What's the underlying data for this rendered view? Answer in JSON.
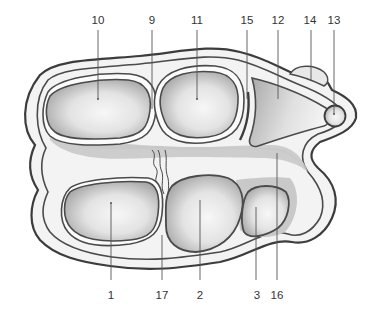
{
  "diagram": {
    "type": "anatomical cross-section",
    "colors": {
      "outline": "#4a4a4a",
      "skin_fill": "#f2f2f2",
      "tissue_fill": "#c8c8c8",
      "bone_dark": "#9e9e9e",
      "bone_light": "#f4f4f4",
      "label_text": "#333333"
    },
    "labels": [
      {
        "id": "1",
        "text": "1",
        "x": 111,
        "y": 296,
        "target": [
          111,
          203
        ],
        "position": "bottom"
      },
      {
        "id": "2",
        "text": "2",
        "x": 200,
        "y": 296,
        "target": [
          200,
          200
        ],
        "position": "bottom"
      },
      {
        "id": "3",
        "text": "3",
        "x": 257,
        "y": 296,
        "target": [
          256,
          207
        ],
        "position": "bottom"
      },
      {
        "id": "16",
        "text": "16",
        "x": 277,
        "y": 296,
        "target": [
          277,
          153
        ],
        "position": "bottom"
      },
      {
        "id": "17",
        "text": "17",
        "x": 162,
        "y": 296,
        "target": [
          162,
          235
        ],
        "position": "bottom"
      },
      {
        "id": "10",
        "text": "10",
        "x": 98,
        "y": 24,
        "target": [
          98,
          99
        ],
        "position": "top"
      },
      {
        "id": "9",
        "text": "9",
        "x": 152,
        "y": 24,
        "target": [
          152,
          109
        ],
        "position": "top"
      },
      {
        "id": "11",
        "text": "11",
        "x": 197,
        "y": 24,
        "target": [
          197,
          99
        ],
        "position": "top"
      },
      {
        "id": "15",
        "text": "15",
        "x": 247,
        "y": 24,
        "target": [
          247,
          99
        ],
        "position": "top"
      },
      {
        "id": "12",
        "text": "12",
        "x": 278,
        "y": 24,
        "target": [
          278,
          99
        ],
        "position": "top"
      },
      {
        "id": "14",
        "text": "14",
        "x": 310,
        "y": 24,
        "target": [
          311,
          80
        ],
        "position": "top"
      },
      {
        "id": "13",
        "text": "13",
        "x": 334,
        "y": 24,
        "target": [
          334,
          114
        ],
        "position": "top"
      }
    ]
  }
}
